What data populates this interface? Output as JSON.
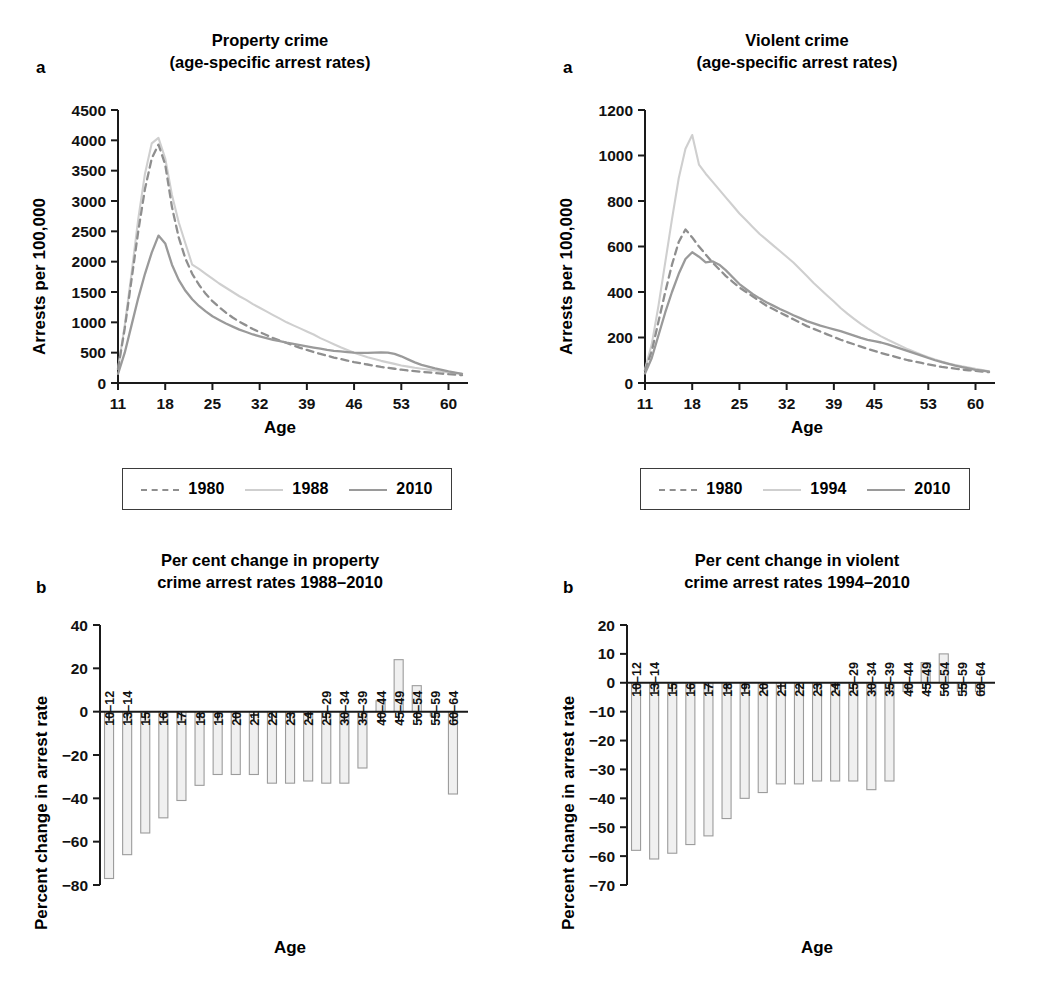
{
  "figure": {
    "panels": [
      {
        "letter": "a",
        "title": "Property crime\n(age-specific arrest rates)",
        "ylabel": "Arrests per 100,000",
        "xlabel": "Age"
      },
      {
        "letter": "a",
        "title": "Violent crime\n(age-specific arrest rates)",
        "ylabel": "Arrests per 100,000",
        "xlabel": "Age"
      },
      {
        "letter": "b",
        "title": "Per cent change in property\ncrime arrest rates 1988–2010",
        "ylabel": "Percent change in arrest rate",
        "xlabel": "Age"
      },
      {
        "letter": "b",
        "title": "Per cent change in violent\ncrime arrest rates 1994–2010",
        "ylabel": "Percent change in arrest rate",
        "xlabel": "Age"
      }
    ]
  },
  "colors": {
    "line_1980": "#8f8f8f",
    "line_mid": "#cfcfcf",
    "line_2010": "#9a9a9a",
    "bar_fill": "#f0f0f0",
    "bar_stroke": "#9c9c9c",
    "axis": "#1a1a1a"
  },
  "legends": [
    {
      "name": "property-legend",
      "entries": [
        {
          "label": "1980",
          "style": "dashed",
          "color": "#8f8f8f"
        },
        {
          "label": "1988",
          "style": "solid-light",
          "color": "#cfcfcf"
        },
        {
          "label": "2010",
          "style": "solid",
          "color": "#9a9a9a"
        }
      ]
    },
    {
      "name": "violent-legend",
      "entries": [
        {
          "label": "1980",
          "style": "dashed",
          "color": "#8f8f8f"
        },
        {
          "label": "1994",
          "style": "solid-light",
          "color": "#cfcfcf"
        },
        {
          "label": "2010",
          "style": "solid",
          "color": "#9a9a9a"
        }
      ]
    }
  ],
  "chart_data": [
    {
      "id": "property-crime-rates",
      "type": "line",
      "title": "Property crime (age-specific arrest rates)",
      "panel_letter": "a",
      "xlabel": "Age",
      "ylabel": "Arrests per 100,000",
      "xlim": [
        11,
        62
      ],
      "ylim": [
        0,
        4500
      ],
      "yticks": [
        0,
        500,
        1000,
        1500,
        2000,
        2500,
        3000,
        3500,
        4000,
        4500
      ],
      "xticks": [
        11,
        18,
        25,
        32,
        39,
        46,
        53,
        60
      ],
      "grid": false,
      "legend_position": "below",
      "x": [
        11,
        12,
        13,
        14,
        15,
        16,
        17,
        18,
        19,
        20,
        21,
        22,
        23,
        24,
        25,
        26,
        27,
        28,
        29,
        30,
        31,
        32,
        33,
        34,
        35,
        36,
        37,
        38,
        39,
        40,
        41,
        42,
        43,
        44,
        45,
        46,
        47,
        48,
        49,
        50,
        51,
        52,
        53,
        54,
        55,
        56,
        57,
        58,
        59,
        60,
        61,
        62
      ],
      "series": [
        {
          "name": "1980",
          "style": "dashed",
          "values": [
            230,
            900,
            1700,
            2500,
            3200,
            3700,
            3930,
            3600,
            2900,
            2400,
            2050,
            1800,
            1620,
            1470,
            1350,
            1250,
            1160,
            1080,
            1010,
            950,
            890,
            840,
            790,
            740,
            700,
            660,
            620,
            580,
            545,
            510,
            480,
            450,
            420,
            395,
            370,
            345,
            325,
            305,
            285,
            265,
            250,
            235,
            220,
            205,
            195,
            185,
            175,
            165,
            155,
            145,
            138,
            130
          ]
        },
        {
          "name": "1988",
          "style": "solid-light",
          "values": [
            230,
            950,
            1800,
            2700,
            3450,
            3950,
            4040,
            3700,
            3100,
            2650,
            2300,
            1950,
            1880,
            1800,
            1720,
            1640,
            1570,
            1500,
            1430,
            1370,
            1300,
            1240,
            1180,
            1120,
            1060,
            1000,
            950,
            900,
            850,
            800,
            740,
            690,
            640,
            590,
            545,
            500,
            460,
            425,
            395,
            365,
            340,
            315,
            290,
            270,
            250,
            235,
            220,
            205,
            190,
            175,
            165,
            150
          ]
        },
        {
          "name": "2010",
          "style": "solid",
          "values": [
            150,
            500,
            950,
            1400,
            1800,
            2150,
            2430,
            2300,
            1950,
            1700,
            1520,
            1380,
            1270,
            1180,
            1100,
            1040,
            980,
            930,
            880,
            840,
            800,
            770,
            740,
            710,
            690,
            665,
            645,
            625,
            605,
            585,
            565,
            545,
            530,
            520,
            510,
            500,
            495,
            495,
            500,
            505,
            500,
            480,
            440,
            390,
            340,
            300,
            270,
            240,
            215,
            190,
            170,
            150
          ]
        }
      ]
    },
    {
      "id": "violent-crime-rates",
      "type": "line",
      "title": "Violent crime (age-specific arrest rates)",
      "panel_letter": "a",
      "xlabel": "Age",
      "ylabel": "Arrests per 100,000",
      "xlim": [
        11,
        62
      ],
      "ylim": [
        0,
        1200
      ],
      "yticks": [
        0,
        200,
        400,
        600,
        800,
        1000,
        1200
      ],
      "xticks": [
        11,
        18,
        25,
        32,
        39,
        45,
        53,
        60
      ],
      "grid": false,
      "legend_position": "below",
      "x": [
        11,
        12,
        13,
        14,
        15,
        16,
        17,
        18,
        19,
        20,
        21,
        22,
        23,
        24,
        25,
        26,
        27,
        28,
        29,
        30,
        31,
        32,
        33,
        34,
        35,
        36,
        37,
        38,
        39,
        40,
        41,
        42,
        43,
        44,
        45,
        46,
        47,
        48,
        49,
        50,
        51,
        52,
        53,
        54,
        55,
        56,
        57,
        58,
        59,
        60,
        61,
        62
      ],
      "series": [
        {
          "name": "1980",
          "style": "dashed",
          "values": [
            55,
            140,
            270,
            400,
            520,
            620,
            675,
            640,
            600,
            565,
            530,
            500,
            470,
            445,
            420,
            400,
            380,
            360,
            340,
            325,
            310,
            295,
            280,
            265,
            250,
            238,
            226,
            214,
            202,
            190,
            180,
            170,
            160,
            150,
            141,
            132,
            124,
            116,
            108,
            100,
            94,
            88,
            82,
            76,
            71,
            67,
            63,
            59,
            56,
            53,
            50,
            48
          ]
        },
        {
          "name": "1994",
          "style": "solid-light",
          "values": [
            60,
            170,
            340,
            530,
            720,
            900,
            1030,
            1090,
            960,
            920,
            885,
            850,
            815,
            780,
            745,
            715,
            685,
            655,
            630,
            605,
            580,
            555,
            530,
            500,
            470,
            440,
            412,
            385,
            358,
            330,
            305,
            282,
            260,
            240,
            222,
            205,
            190,
            176,
            162,
            148,
            136,
            124,
            113,
            103,
            94,
            86,
            79,
            73,
            68,
            62,
            57,
            52
          ]
        },
        {
          "name": "2010",
          "style": "solid",
          "values": [
            42,
            110,
            210,
            310,
            400,
            480,
            545,
            575,
            555,
            530,
            535,
            520,
            495,
            465,
            435,
            412,
            390,
            372,
            355,
            340,
            325,
            312,
            298,
            285,
            272,
            262,
            252,
            244,
            236,
            228,
            218,
            208,
            198,
            190,
            184,
            178,
            170,
            160,
            150,
            140,
            130,
            120,
            110,
            100,
            92,
            84,
            76,
            70,
            64,
            58,
            54,
            50
          ]
        }
      ]
    },
    {
      "id": "property-crime-percent-change",
      "type": "bar",
      "title": "Per cent change in property crime arrest rates 1988–2010",
      "panel_letter": "b",
      "xlabel": "Age",
      "ylabel": "Percent change in arrest rate",
      "ylim": [
        -80,
        40
      ],
      "yticks": [
        40,
        20,
        0,
        -20,
        -40,
        -60,
        -80
      ],
      "ytick_labels": [
        "40",
        "20",
        "0",
        "−20",
        "−40",
        "−60",
        "−80"
      ],
      "grid": false,
      "categories": [
        "10–12",
        "13–14",
        "15",
        "16",
        "17",
        "18",
        "19",
        "20",
        "21",
        "22",
        "23",
        "24",
        "25–29",
        "30–34",
        "35–39",
        "40–44",
        "45–49",
        "50–54",
        "55–59",
        "60–64"
      ],
      "values": [
        -77,
        -66,
        -56,
        -49,
        -41,
        -34,
        -29,
        -29,
        -29,
        -33,
        -33,
        -32,
        -33,
        -33,
        -26,
        5,
        24,
        12,
        -2,
        -38
      ]
    },
    {
      "id": "violent-crime-percent-change",
      "type": "bar",
      "title": "Per cent change in violent crime arrest rates 1994–2010",
      "panel_letter": "b",
      "xlabel": "Age",
      "ylabel": "Percent change in arrest rate",
      "ylim": [
        -70,
        20
      ],
      "yticks": [
        20,
        10,
        0,
        -10,
        -20,
        -30,
        -40,
        -50,
        -60,
        -70
      ],
      "ytick_labels": [
        "20",
        "10",
        "0",
        "−10",
        "−20",
        "−30",
        "−40",
        "−50",
        "−60",
        "−70"
      ],
      "grid": false,
      "categories": [
        "10–12",
        "13–14",
        "15",
        "16",
        "17",
        "18",
        "19",
        "20",
        "21",
        "22",
        "23",
        "24",
        "25–29",
        "30–34",
        "35–39",
        "40–44",
        "45–49",
        "50–54",
        "55–59",
        "60–64"
      ],
      "values": [
        -58,
        -61,
        -59,
        -56,
        -53,
        -47,
        -40,
        -38,
        -35,
        -35,
        -34,
        -34,
        -34,
        -37,
        -34,
        -3,
        7,
        10,
        -3,
        -3
      ]
    }
  ]
}
